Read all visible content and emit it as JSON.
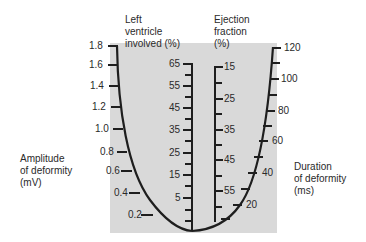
{
  "diagram": {
    "type": "nomogram",
    "background_color": "#d9d9d9",
    "line_color": "#1e1e1e",
    "axes": [
      {
        "id": "amplitude",
        "title_lines": [
          "Amplitude",
          "of deformity",
          "(mV)"
        ],
        "ticks": [
          "1.8",
          "1.6",
          "1.4",
          "1.2",
          "1.0",
          "0.8",
          "0.6",
          "0.4",
          "0.2"
        ]
      },
      {
        "id": "lv_involved",
        "title_lines": [
          "Left",
          "ventricle",
          "involved (%)"
        ],
        "ticks": [
          "65",
          "55",
          "45",
          "35",
          "25",
          "15",
          "5"
        ]
      },
      {
        "id": "ejection_fraction",
        "title_lines": [
          "Ejection",
          "fraction",
          "(%)"
        ],
        "ticks": [
          "15",
          "25",
          "35",
          "45",
          "55"
        ]
      },
      {
        "id": "duration",
        "title_lines": [
          "Duration",
          "of deformity",
          "(ms)"
        ],
        "ticks": [
          "120",
          "100",
          "80",
          "60",
          "40",
          "20"
        ]
      }
    ]
  }
}
